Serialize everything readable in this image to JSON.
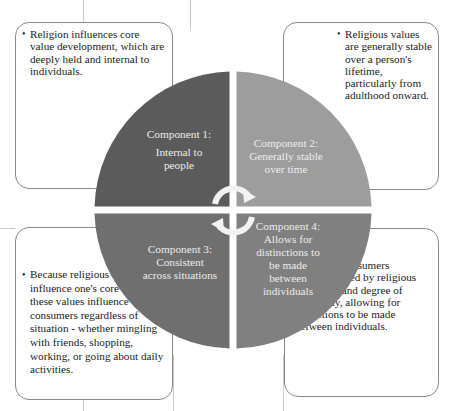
{
  "diagram": {
    "type": "four-quadrant circle",
    "colors": {
      "q1": "#5b5b5b",
      "q2": "#9d9d9d",
      "q3": "#6f6f6f",
      "q4": "#808080",
      "quadrant_text": "#ececec",
      "arrow": "#f2f2f2",
      "box_border": "#8a8a8a"
    },
    "quadrants": [
      {
        "id": 1,
        "title": "Component 1:",
        "lines": [
          "Internal to",
          "people"
        ]
      },
      {
        "id": 2,
        "title": "Component 2:",
        "lines": [
          "Generally stable",
          "over time"
        ]
      },
      {
        "id": 3,
        "title": "Component 3:",
        "lines": [
          "Consistent",
          "across situations"
        ]
      },
      {
        "id": 4,
        "title": "Component 4:",
        "lines": [
          "Allows for",
          "distinctions to",
          "be made",
          "between",
          "individuals"
        ]
      }
    ],
    "boxes": {
      "top_left": {
        "bullet": "Religion influences core value development, which are deeply held and internal to individuals."
      },
      "top_right": {
        "bullet": "Religious values are generally stable over a person's lifetime, particularly from adulthood onward."
      },
      "bottom_left": {
        "bullet": "Because religious values influence one's core values, these values influence consumers regardless of situation - whether mingling with friends, shopping, working, or going about daily activities."
      },
      "bottom_right": {
        "lead": "Consumers",
        "text": "can be divided by religious affiliation and degree of religiosity, allowing for disinctions to be made between individuals."
      }
    },
    "arrows": [
      "cycle-arrow-clockwise-top",
      "cycle-arrow-clockwise-bottom"
    ]
  }
}
